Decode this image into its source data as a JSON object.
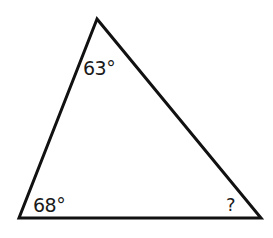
{
  "diagram": {
    "type": "triangle",
    "stroke_color": "#111111",
    "stroke_width": 3,
    "vertices": {
      "top": [
        97,
        19
      ],
      "bottom_left": [
        19,
        218
      ],
      "bottom_right": [
        261,
        218
      ]
    },
    "angles": {
      "top": "63°",
      "bottom_left": "68°",
      "bottom_right": "?"
    }
  }
}
